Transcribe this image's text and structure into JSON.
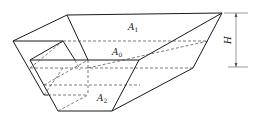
{
  "diagram": {
    "type": "geometric-solid",
    "labels": {
      "top_area": {
        "main": "A",
        "sub": "1"
      },
      "mid_area": {
        "main": "A",
        "sub": "0"
      },
      "bottom_area": {
        "main": "A",
        "sub": "2"
      },
      "height": "H"
    },
    "colors": {
      "line": "#1a1a1a",
      "dashed": "#444444",
      "background": "#ffffff"
    }
  }
}
